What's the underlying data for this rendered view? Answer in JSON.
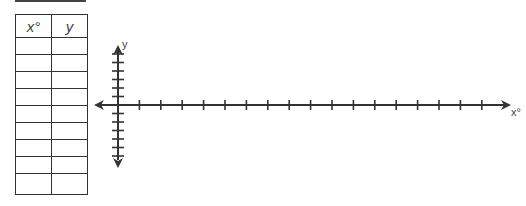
{
  "table": {
    "headers": [
      "x°",
      "y"
    ],
    "rows": [
      [
        "",
        ""
      ],
      [
        "",
        ""
      ],
      [
        "",
        ""
      ],
      [
        "",
        ""
      ],
      [
        "",
        ""
      ],
      [
        "",
        ""
      ],
      [
        "",
        ""
      ],
      [
        "",
        ""
      ],
      [
        "",
        ""
      ]
    ]
  },
  "axes": {
    "x_label": "x°",
    "y_label": "y",
    "origin": [
      118,
      105
    ],
    "x_tick_count": 17,
    "x_tick_spacing": 21.4,
    "y_ticks_above": 6,
    "y_ticks_below": 6,
    "y_tick_spacing": 8.5,
    "color": "#333333"
  }
}
